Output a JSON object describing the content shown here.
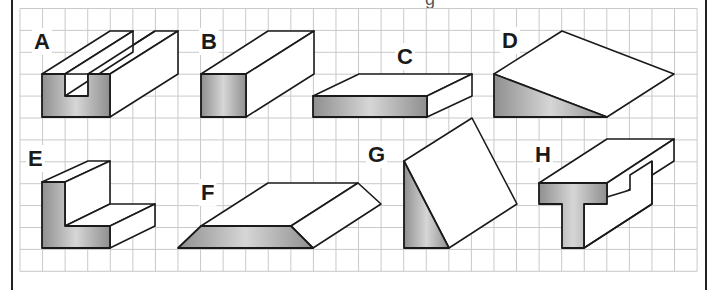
{
  "figure": {
    "title_fragment": "g",
    "grid": {
      "columns": 30,
      "rows": 12,
      "origin_x": 20,
      "origin_y": 8.5,
      "cell_w": 22.57,
      "cell_h": 21.9,
      "line_color": "#c9c9c9"
    },
    "colors": {
      "edge": "#1a1a1a",
      "front_face_dark": "#8f8f8f",
      "front_face_light": "#d6d6d6",
      "top_face": "#ffffff",
      "frame": "#222222"
    },
    "shapes": [
      {
        "label": "A",
        "description": "U-channel prism",
        "label_pos": [
          34,
          49
        ]
      },
      {
        "label": "B",
        "description": "square prism",
        "label_pos": [
          201,
          49
        ]
      },
      {
        "label": "C",
        "description": "flat rectangular slab",
        "label_pos": [
          397,
          64
        ]
      },
      {
        "label": "D",
        "description": "triangular wedge",
        "label_pos": [
          502,
          48
        ]
      },
      {
        "label": "E",
        "description": "L-shaped prism",
        "label_pos": [
          28,
          166
        ]
      },
      {
        "label": "F",
        "description": "trapezoidal prism",
        "label_pos": [
          201,
          200
        ]
      },
      {
        "label": "G",
        "description": "upright triangular prism",
        "label_pos": [
          368,
          162
        ]
      },
      {
        "label": "H",
        "description": "T-shaped prism",
        "label_pos": [
          535,
          162
        ]
      }
    ]
  }
}
